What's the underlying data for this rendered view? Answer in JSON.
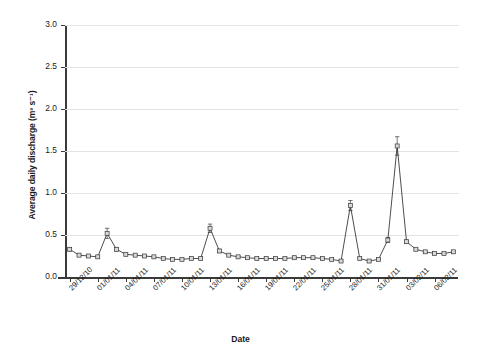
{
  "axes": {
    "ylabel": "Average daily discharge (m³ s⁻¹)",
    "xlabel": "Date",
    "ytick_labels": [
      "0.0",
      "0.5",
      "1.0",
      "1.5",
      "2.0",
      "2.5",
      "3.0"
    ],
    "xtick_labels": [
      "29/12/10",
      "01/01/11",
      "04/01/11",
      "07/01/11",
      "10/01/11",
      "13/01/11",
      "16/01/11",
      "19/01/11",
      "22/01/11",
      "25/01/11",
      "28/01/11",
      "31/01/11",
      "03/02/11",
      "06/02/11"
    ]
  },
  "style": {
    "line_color": "#3a3a3a",
    "marker_fill": "#d9d9d9",
    "marker_stroke": "#3a3a3a",
    "grid_color": "#e3e3e3",
    "axis_color": "#3a3a3a"
  },
  "chart_data": {
    "type": "line",
    "title": "",
    "xlabel": "Date",
    "ylabel": "Average daily discharge (m³ s⁻¹)",
    "ylim": [
      0.0,
      3.0
    ],
    "yticks": [
      0.0,
      0.5,
      1.0,
      1.5,
      2.0,
      2.5,
      3.0
    ],
    "grid": true,
    "legend": false,
    "markers": "square",
    "error_bars": true,
    "x": [
      "29/12/10",
      "30/12/10",
      "31/12/10",
      "01/01/11",
      "02/01/11",
      "03/01/11",
      "04/01/11",
      "05/01/11",
      "06/01/11",
      "07/01/11",
      "08/01/11",
      "09/01/11",
      "10/01/11",
      "11/01/11",
      "12/01/11",
      "13/01/11",
      "14/01/11",
      "15/01/11",
      "16/01/11",
      "17/01/11",
      "18/01/11",
      "19/01/11",
      "20/01/11",
      "21/01/11",
      "22/01/11",
      "23/01/11",
      "24/01/11",
      "25/01/11",
      "26/01/11",
      "27/01/11",
      "28/01/11",
      "29/01/11",
      "30/01/11",
      "31/01/11",
      "01/02/11",
      "02/02/11",
      "03/02/11",
      "04/02/11",
      "05/02/11",
      "06/02/11",
      "07/02/11",
      "08/02/11"
    ],
    "xtick_interval_days": 3,
    "values": [
      0.33,
      0.26,
      0.25,
      0.24,
      0.52,
      0.33,
      0.27,
      0.26,
      0.25,
      0.24,
      0.22,
      0.21,
      0.21,
      0.22,
      0.22,
      0.58,
      0.31,
      0.26,
      0.24,
      0.23,
      0.22,
      0.22,
      0.22,
      0.22,
      0.23,
      0.23,
      0.23,
      0.22,
      0.21,
      0.19,
      0.85,
      0.22,
      0.19,
      0.21,
      0.44,
      1.56,
      0.42,
      0.33,
      0.3,
      0.28,
      0.28,
      0.3
    ],
    "errors": [
      0.02,
      0.01,
      0.01,
      0.01,
      0.06,
      0.02,
      0.01,
      0.01,
      0.01,
      0.01,
      0.01,
      0.01,
      0.01,
      0.01,
      0.01,
      0.05,
      0.02,
      0.01,
      0.01,
      0.01,
      0.01,
      0.01,
      0.01,
      0.01,
      0.01,
      0.01,
      0.01,
      0.01,
      0.01,
      0.01,
      0.06,
      0.01,
      0.01,
      0.01,
      0.03,
      0.11,
      0.02,
      0.01,
      0.01,
      0.01,
      0.01,
      0.01
    ]
  }
}
